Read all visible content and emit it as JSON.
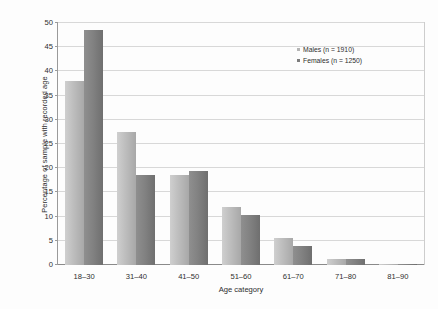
{
  "chart_data": {
    "type": "bar",
    "title": "",
    "xlabel": "Age category",
    "ylabel": "Percentage of sample with recorded age",
    "categories": [
      "18–30",
      "31–40",
      "41–50",
      "51–60",
      "61–70",
      "71–80",
      "81–90"
    ],
    "series": [
      {
        "name": "Males (n = 1910)",
        "color": "#b5b5b5",
        "values": [
          38.0,
          27.5,
          18.5,
          12.0,
          5.5,
          1.2,
          0.2
        ]
      },
      {
        "name": "Females (n = 1250)",
        "color": "#7d7d7d",
        "values": [
          48.5,
          18.7,
          19.5,
          10.3,
          4.0,
          1.3,
          0.2
        ]
      }
    ],
    "ylim": [
      0,
      50
    ],
    "yticks": [
      0,
      5,
      10,
      15,
      20,
      25,
      30,
      35,
      40,
      45,
      50
    ],
    "ytick_labels": [
      "0",
      "5",
      "10",
      "15",
      "20",
      "25",
      "30",
      "35",
      "40",
      "45",
      "50"
    ],
    "grid": true,
    "legend_position": "top-right"
  },
  "legend": {
    "entries": [
      {
        "label": "Males (n = 1910)"
      },
      {
        "label": "Females (n = 1250)"
      }
    ]
  }
}
